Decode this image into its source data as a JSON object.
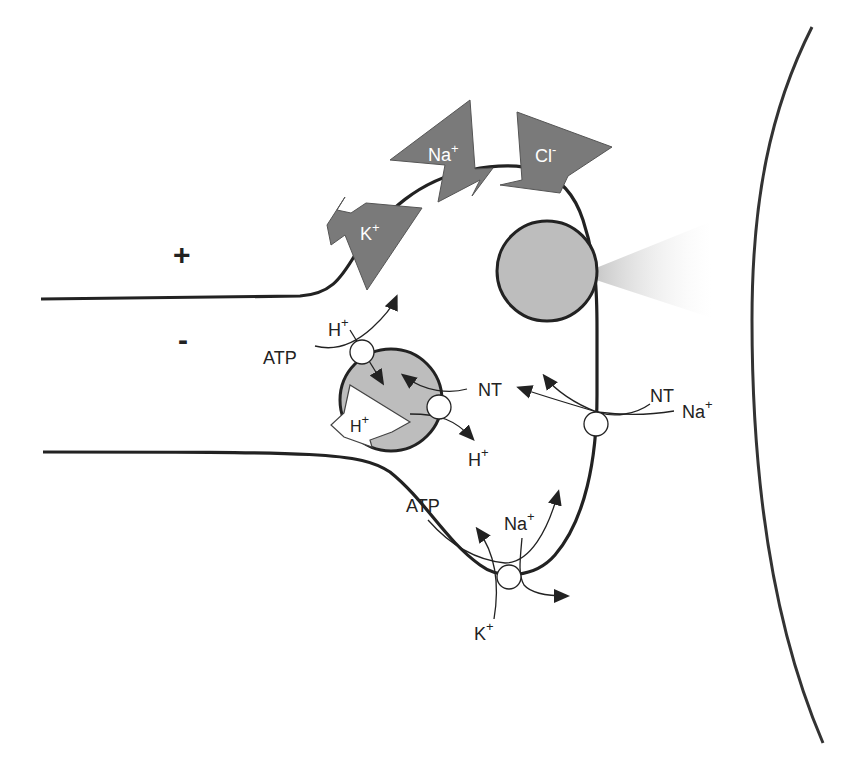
{
  "diagram": {
    "colors": {
      "membrane": "#222222",
      "channel_arrow": "#777777",
      "vesicle_fill": "#bdbdbd",
      "transporter_fill": "#ffffff",
      "release_cone": "#d0d0d0"
    },
    "charges": {
      "outside": "+",
      "inside": "-"
    },
    "channels": [
      {
        "ion": "K",
        "charge": "+",
        "direction": "outward"
      },
      {
        "ion": "Na",
        "charge": "+",
        "direction": "inward"
      },
      {
        "ion": "Cl",
        "charge": "-",
        "direction": "inward"
      }
    ],
    "vesicle_transport": {
      "pump": {
        "substrate": "ATP",
        "ion": "H",
        "ion_charge": "+"
      },
      "proton_gradient": {
        "ion": "H",
        "ion_charge": "+"
      },
      "antiporter": {
        "substrate": "NT",
        "ion": "H",
        "ion_charge": "+"
      }
    },
    "membrane_reuptake": {
      "substrate": "NT",
      "ion": "Na",
      "ion_charge": "+"
    },
    "nak_pump": {
      "substrate": "ATP",
      "ion_out": "Na",
      "ion_out_charge": "+",
      "ion_in": "K",
      "ion_in_charge": "+"
    }
  }
}
